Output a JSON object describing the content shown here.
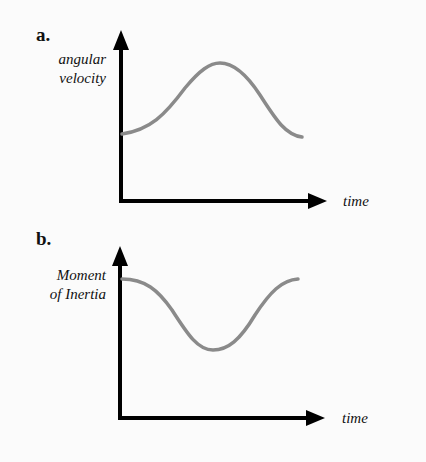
{
  "panels": [
    {
      "letter": "a.",
      "ylabel_line1": "angular",
      "ylabel_line2": "velocity",
      "xlabel": "time",
      "curve": "smooth rise to a single maximum then fall"
    },
    {
      "letter": "b.",
      "ylabel_line1": "Moment",
      "ylabel_line2": "of Inertia",
      "xlabel": "time",
      "curve": "smooth fall to a single minimum then rise"
    }
  ],
  "colors": {
    "axis": "#000000",
    "curve": "#8a8a8a",
    "background": "#fbfbfb"
  }
}
